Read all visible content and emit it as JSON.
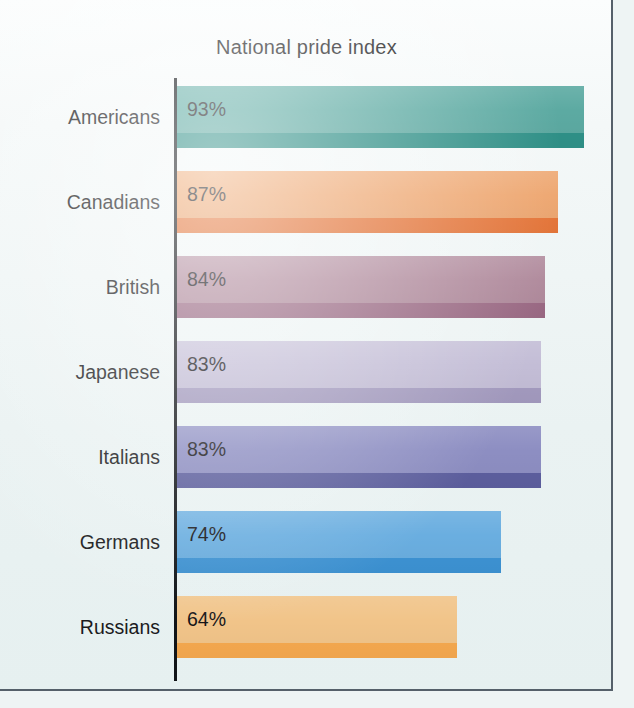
{
  "chart_data": {
    "type": "bar",
    "orientation": "horizontal",
    "title": "National pride index",
    "xlabel": "",
    "ylabel": "",
    "xlim": [
      0,
      100
    ],
    "grid": false,
    "legend": false,
    "value_suffix": "%",
    "categories": [
      "Americans",
      "Canadians",
      "British",
      "Japanese",
      "Italians",
      "Germans",
      "Russians"
    ],
    "values": [
      93,
      87,
      84,
      83,
      83,
      74,
      64
    ],
    "value_labels": [
      "93%",
      "87%",
      "84%",
      "83%",
      "83%",
      "74%",
      "64%"
    ],
    "bars": [
      {
        "category": "Americans",
        "value": 93,
        "value_label": "93%",
        "color": "#5caaa2",
        "stripe_color": "#2f9289"
      },
      {
        "category": "Canadians",
        "value": 87,
        "value_label": "87%",
        "color": "#eea771",
        "stripe_color": "#e8773a"
      },
      {
        "category": "British",
        "value": 84,
        "value_label": "84%",
        "color": "#b08a9c",
        "stripe_color": "#9c6a85"
      },
      {
        "category": "Japanese",
        "value": 83,
        "value_label": "83%",
        "color": "#c3bdd6",
        "stripe_color": "#a49bc0"
      },
      {
        "category": "Italians",
        "value": 83,
        "value_label": "83%",
        "color": "#8d8ec2",
        "stripe_color": "#5d5f9f"
      },
      {
        "category": "Germans",
        "value": 74,
        "value_label": "74%",
        "color": "#6aaee0",
        "stripe_color": "#3d93d4"
      },
      {
        "category": "Russians",
        "value": 64,
        "value_label": "64%",
        "color": "#f1c489",
        "stripe_color": "#f6a94f"
      }
    ]
  },
  "layout": {
    "plot_left": 177,
    "axis_x": 174,
    "first_row_top": 86,
    "row_pitch": 85,
    "bar_height": 62,
    "stripe_height": 15,
    "px_per_unit": 4.38,
    "background_color": "#eef4f4",
    "axis_color": "#111418",
    "text_color": "#1b1b1d"
  }
}
